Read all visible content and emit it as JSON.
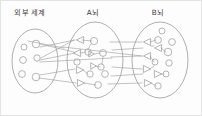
{
  "figure": {
    "title_visible": false,
    "background_color": "#fdfdfd",
    "stroke_color": "#9d9d9d",
    "text_color": "#3b3b3b",
    "width": 202,
    "height": 116
  },
  "labels": [
    {
      "id": "external-world",
      "text": "외부 세계",
      "x": 30,
      "y": 13
    },
    {
      "id": "brain-a",
      "text": "A뇌",
      "x": 93,
      "y": 13
    },
    {
      "id": "brain-b",
      "text": "B뇌",
      "x": 158,
      "y": 13
    }
  ],
  "regions": [
    {
      "id": "external-world",
      "label": "외부 세계",
      "cx": 35,
      "cy": 61,
      "rx": 23,
      "ry": 32
    },
    {
      "id": "brain-a",
      "label": "A뇌",
      "cx": 95,
      "cy": 60,
      "rx": 28,
      "ry": 38
    },
    {
      "id": "brain-b",
      "label": "B뇌",
      "cx": 160,
      "cy": 60,
      "rx": 28,
      "ry": 38
    }
  ],
  "nodes": {
    "external_world_circles": [
      {
        "cx": 24,
        "cy": 47,
        "r": 3.0
      },
      {
        "cx": 36,
        "cy": 44,
        "r": 3.8
      },
      {
        "cx": 23,
        "cy": 60,
        "r": 3.4
      },
      {
        "cx": 37,
        "cy": 58,
        "r": 3.2
      },
      {
        "cx": 22,
        "cy": 74,
        "r": 3.4
      },
      {
        "cx": 36,
        "cy": 77,
        "r": 3.8
      }
    ],
    "brain_a_triangles_left": [
      {
        "cx": 79,
        "cy": 40,
        "size": 5.2,
        "dir": "left"
      },
      {
        "cx": 76,
        "cy": 53,
        "size": 5.2,
        "dir": "left"
      }
    ],
    "brain_a_triangles_right": [
      {
        "cx": 79,
        "cy": 70,
        "size": 5.2,
        "dir": "right"
      },
      {
        "cx": 80,
        "cy": 83,
        "size": 5.2,
        "dir": "right"
      },
      {
        "cx": 93,
        "cy": 66,
        "size": 4.6,
        "dir": "right"
      },
      {
        "cx": 91,
        "cy": 54,
        "size": 4.4,
        "dir": "right"
      }
    ],
    "brain_a_circles": [
      {
        "cx": 94,
        "cy": 41,
        "r": 3.6
      },
      {
        "cx": 88,
        "cy": 52,
        "r": 3.2
      },
      {
        "cx": 103,
        "cy": 53,
        "r": 3.4
      },
      {
        "cx": 77,
        "cy": 62,
        "r": 3.2
      },
      {
        "cx": 101,
        "cy": 67,
        "r": 3.2
      },
      {
        "cx": 90,
        "cy": 74,
        "r": 3.2
      },
      {
        "cx": 105,
        "cy": 74,
        "r": 3.4
      },
      {
        "cx": 98,
        "cy": 85,
        "r": 3.4
      }
    ],
    "brain_b_triangles_left": [
      {
        "cx": 146,
        "cy": 42,
        "size": 5.2,
        "dir": "left"
      },
      {
        "cx": 157,
        "cy": 48,
        "size": 5.2,
        "dir": "left"
      },
      {
        "cx": 146,
        "cy": 56,
        "size": 5.2,
        "dir": "left"
      }
    ],
    "brain_b_triangles_right": [
      {
        "cx": 146,
        "cy": 69,
        "size": 5.2,
        "dir": "right"
      },
      {
        "cx": 157,
        "cy": 74,
        "size": 5.2,
        "dir": "right"
      },
      {
        "cx": 147,
        "cy": 83,
        "size": 5.2,
        "dir": "right"
      }
    ],
    "brain_b_circles": [
      {
        "cx": 162,
        "cy": 31,
        "r": 3.0
      },
      {
        "cx": 158,
        "cy": 40,
        "r": 3.4
      },
      {
        "cx": 172,
        "cy": 42,
        "r": 3.4
      },
      {
        "cx": 168,
        "cy": 52,
        "r": 3.8
      },
      {
        "cx": 155,
        "cy": 62,
        "r": 3.0
      },
      {
        "cx": 169,
        "cy": 63,
        "r": 3.2
      },
      {
        "cx": 166,
        "cy": 74,
        "r": 3.0
      },
      {
        "cx": 158,
        "cy": 86,
        "r": 3.2
      }
    ]
  },
  "links": {
    "external_to_a": [
      {
        "x1": 40,
        "y1": 44,
        "x2": 74,
        "y2": 52
      },
      {
        "x1": 40,
        "y1": 47,
        "x2": 75,
        "y2": 40
      },
      {
        "x1": 41,
        "y1": 58,
        "x2": 74,
        "y2": 40
      },
      {
        "x1": 40,
        "y1": 60,
        "x2": 75,
        "y2": 53
      },
      {
        "x1": 40,
        "y1": 75,
        "x2": 75,
        "y2": 69
      },
      {
        "x1": 39,
        "y1": 78,
        "x2": 76,
        "y2": 83
      }
    ],
    "a_to_b": [
      {
        "x1": 110,
        "y1": 42,
        "x2": 142,
        "y2": 42
      },
      {
        "x1": 112,
        "y1": 50,
        "x2": 143,
        "y2": 48
      },
      {
        "x1": 111,
        "y1": 57,
        "x2": 142,
        "y2": 56
      },
      {
        "x1": 112,
        "y1": 67,
        "x2": 142,
        "y2": 69
      },
      {
        "x1": 111,
        "y1": 76,
        "x2": 143,
        "y2": 74
      },
      {
        "x1": 108,
        "y1": 84,
        "x2": 142,
        "y2": 83
      }
    ],
    "a_internal": [
      {
        "x1": 82,
        "y1": 40,
        "x2": 92,
        "y2": 41
      },
      {
        "x1": 80,
        "y1": 53,
        "x2": 86,
        "y2": 52
      },
      {
        "x1": 94,
        "y1": 54,
        "x2": 100,
        "y2": 53
      },
      {
        "x1": 83,
        "y1": 70,
        "x2": 88,
        "y2": 74
      },
      {
        "x1": 96,
        "y1": 66,
        "x2": 100,
        "y2": 67
      },
      {
        "x1": 84,
        "y1": 83,
        "x2": 96,
        "y2": 85
      }
    ],
    "b_internal": [
      {
        "x1": 150,
        "y1": 42,
        "x2": 156,
        "y2": 40
      },
      {
        "x1": 161,
        "y1": 48,
        "x2": 166,
        "y2": 52
      },
      {
        "x1": 150,
        "y1": 56,
        "x2": 154,
        "y2": 62
      },
      {
        "x1": 150,
        "y1": 69,
        "x2": 154,
        "y2": 66
      },
      {
        "x1": 161,
        "y1": 74,
        "x2": 164,
        "y2": 74
      },
      {
        "x1": 151,
        "y1": 83,
        "x2": 156,
        "y2": 86
      }
    ],
    "cross_long": [
      {
        "x1": 40,
        "y1": 62,
        "x2": 112,
        "y2": 58
      },
      {
        "x1": 63,
        "y1": 47,
        "x2": 142,
        "y2": 56
      }
    ]
  },
  "legend": {
    "circle_meaning": "neuron",
    "triangle_left_meaning": "input-receptor",
    "triangle_right_meaning": "output-effector"
  }
}
